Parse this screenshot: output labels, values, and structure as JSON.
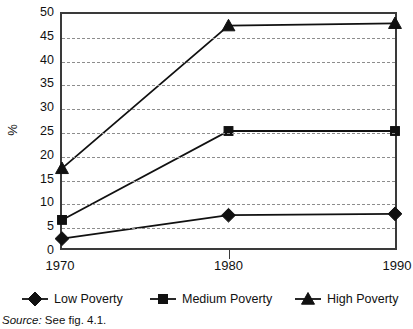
{
  "chart_data": {
    "type": "line",
    "title": "",
    "subtitle": "",
    "xlabel": "",
    "ylabel": "%",
    "categories": [
      "1970",
      "1980",
      "1990"
    ],
    "x": [
      1970,
      1980,
      1990
    ],
    "xlim": [
      1970,
      1990
    ],
    "ylim": [
      0,
      50
    ],
    "yticks": [
      0,
      5,
      10,
      15,
      20,
      25,
      30,
      35,
      40,
      45,
      50
    ],
    "ytick_labels": [
      "0",
      "5",
      "10",
      "15",
      "20",
      "25",
      "30",
      "35",
      "40",
      "45",
      "50"
    ],
    "grid": "horizontal-dashed",
    "legend_position": "bottom",
    "series": [
      {
        "name": "Low Poverty",
        "marker": "diamond",
        "color": "#111111",
        "values": [
          2,
          7,
          7.3
        ]
      },
      {
        "name": "Medium Poverty",
        "marker": "square",
        "color": "#111111",
        "values": [
          6,
          25,
          25
        ]
      },
      {
        "name": "High Poverty",
        "marker": "triangle",
        "color": "#111111",
        "values": [
          17,
          47.5,
          48
        ]
      }
    ],
    "annotations": []
  },
  "axis": {
    "y_title": "%",
    "y_tick_labels": [
      "50",
      "45",
      "40",
      "35",
      "30",
      "25",
      "20",
      "15",
      "10",
      "5",
      "0"
    ],
    "x_tick_labels": [
      "1970",
      "1980",
      "1990"
    ]
  },
  "legend": {
    "items": [
      {
        "label": "Low Poverty",
        "marker": "diamond"
      },
      {
        "label": "Medium Poverty",
        "marker": "square"
      },
      {
        "label": "High Poverty",
        "marker": "triangle"
      }
    ]
  },
  "source": {
    "label": "Source:",
    "text": "See fig. 4.1."
  },
  "colors": {
    "ink": "#111111",
    "axis": "#3a3a3a",
    "grid": "#8d8d8d",
    "background": "#ffffff"
  }
}
